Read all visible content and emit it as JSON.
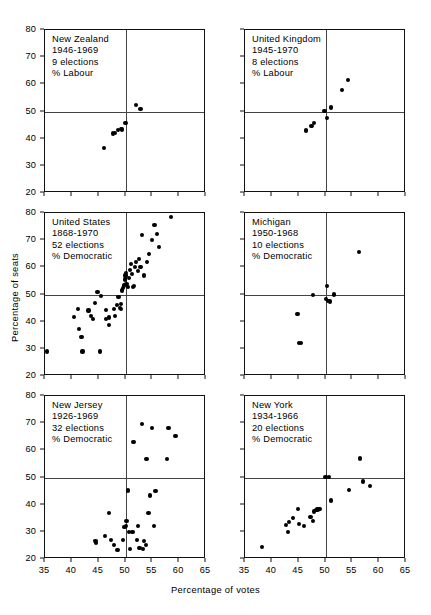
{
  "figure": {
    "xlabel": "Percentage of votes",
    "ylabel": "Percentage of seats"
  },
  "axes": {
    "xlim": [
      35,
      65
    ],
    "ylim": [
      20,
      80
    ],
    "xticks": [
      35,
      40,
      45,
      50,
      55,
      60,
      65
    ],
    "yticks": [
      20,
      30,
      40,
      50,
      60,
      70,
      80
    ],
    "reference_x": 50,
    "reference_y": 50,
    "grid": false
  },
  "chart_data": {
    "type": "scatter",
    "title": "",
    "xlabel": "Percentage of votes",
    "ylabel": "Percentage of seats",
    "xlim": [
      35,
      65
    ],
    "ylim": [
      20,
      80
    ],
    "xticks": [
      35,
      40,
      45,
      50,
      55,
      60,
      65
    ],
    "yticks": [
      20,
      30,
      40,
      50,
      60,
      70,
      80
    ],
    "grid": false,
    "legend": "none",
    "reference_lines": {
      "vertical_x": 50,
      "horizontal_y": 50
    },
    "panels": [
      {
        "id": "new-zealand",
        "row": 0,
        "col": 0,
        "caption_lines": [
          "New Zealand",
          "1946-1969",
          "9 elections",
          "% Labour"
        ],
        "region": "New Zealand",
        "period": "1946-1969",
        "elections": 9,
        "party": "% Labour",
        "points": [
          [
            46.0,
            36.7
          ],
          [
            47.6,
            41.9
          ],
          [
            48.1,
            42.0
          ],
          [
            48.6,
            43.2
          ],
          [
            49.2,
            43.5
          ],
          [
            49.3,
            43.4
          ],
          [
            50.0,
            45.8
          ],
          [
            51.9,
            52.3
          ],
          [
            52.8,
            50.8
          ]
        ]
      },
      {
        "id": "united-kingdom",
        "row": 0,
        "col": 1,
        "caption_lines": [
          "United Kingdom",
          "1945-1970",
          "8 elections",
          "% Labour"
        ],
        "region": "United Kingdom",
        "period": "1945-1970",
        "elections": 8,
        "party": "% Labour",
        "points": [
          [
            46.4,
            43.0
          ],
          [
            47.4,
            44.6
          ],
          [
            47.9,
            45.8
          ],
          [
            49.8,
            50.2
          ],
          [
            50.3,
            47.7
          ],
          [
            51.0,
            51.5
          ],
          [
            53.0,
            58.0
          ],
          [
            54.2,
            61.6
          ]
        ]
      },
      {
        "id": "united-states",
        "row": 1,
        "col": 0,
        "caption_lines": [
          "United States",
          "1868-1970",
          "52 elections",
          "% Democratic"
        ],
        "region": "United States",
        "period": "1868-1970",
        "elections": 52,
        "party": "% Democratic",
        "points": [
          [
            35.4,
            29.0
          ],
          [
            41.1,
            44.7
          ],
          [
            40.4,
            41.8
          ],
          [
            41.3,
            37.4
          ],
          [
            41.8,
            34.4
          ],
          [
            42.0,
            29.0
          ],
          [
            43.1,
            44.1
          ],
          [
            43.5,
            42.0
          ],
          [
            44.0,
            41.0
          ],
          [
            44.3,
            47.0
          ],
          [
            44.8,
            51.0
          ],
          [
            45.4,
            49.5
          ],
          [
            45.3,
            29.0
          ],
          [
            46.3,
            44.4
          ],
          [
            46.4,
            41.1
          ],
          [
            46.9,
            41.5
          ],
          [
            47.0,
            38.8
          ],
          [
            47.8,
            44.6
          ],
          [
            48.1,
            42.0
          ],
          [
            48.4,
            46.0
          ],
          [
            48.7,
            49.0
          ],
          [
            48.9,
            45.0
          ],
          [
            49.1,
            44.8
          ],
          [
            49.2,
            46.5
          ],
          [
            49.4,
            51.5
          ],
          [
            49.6,
            52.5
          ],
          [
            49.7,
            53.3
          ],
          [
            49.9,
            55.5
          ],
          [
            50.0,
            57.0
          ],
          [
            50.1,
            58.0
          ],
          [
            50.2,
            54.0
          ],
          [
            50.4,
            52.8
          ],
          [
            50.6,
            56.0
          ],
          [
            50.8,
            59.0
          ],
          [
            51.0,
            61.2
          ],
          [
            51.2,
            57.4
          ],
          [
            51.4,
            52.8
          ],
          [
            51.6,
            53.0
          ],
          [
            51.8,
            60.0
          ],
          [
            52.0,
            62.0
          ],
          [
            52.3,
            58.6
          ],
          [
            52.5,
            63.0
          ],
          [
            52.8,
            60.0
          ],
          [
            53.1,
            72.0
          ],
          [
            53.4,
            57.0
          ],
          [
            54.0,
            62.0
          ],
          [
            54.4,
            65.0
          ],
          [
            55.0,
            70.0
          ],
          [
            55.4,
            75.5
          ],
          [
            55.8,
            72.3
          ],
          [
            56.2,
            67.5
          ],
          [
            58.5,
            78.4
          ]
        ]
      },
      {
        "id": "michigan",
        "row": 1,
        "col": 1,
        "caption_lines": [
          "Michigan",
          "1950-1968",
          "10 elections",
          "% Democratic"
        ],
        "region": "Michigan",
        "period": "1950-1968",
        "elections": 10,
        "party": "% Democratic",
        "points": [
          [
            45.0,
            32.2
          ],
          [
            45.5,
            32.2
          ],
          [
            44.8,
            42.8
          ],
          [
            47.6,
            49.8
          ],
          [
            50.1,
            48.4
          ],
          [
            50.3,
            53.2
          ],
          [
            50.5,
            47.6
          ],
          [
            50.8,
            47.4
          ],
          [
            51.6,
            50.0
          ],
          [
            56.2,
            65.5
          ]
        ]
      },
      {
        "id": "new-jersey",
        "row": 2,
        "col": 0,
        "caption_lines": [
          "New Jersey",
          "1926-1969",
          "32 elections",
          "% Democratic"
        ],
        "region": "New Jersey",
        "period": "1926-1969",
        "elections": 32,
        "party": "% Democratic",
        "points": [
          [
            43.6,
            19.8
          ],
          [
            44.4,
            26.7
          ],
          [
            44.5,
            25.9
          ],
          [
            45.6,
            20.0
          ],
          [
            46.2,
            28.5
          ],
          [
            46.9,
            37.0
          ],
          [
            47.3,
            26.9
          ],
          [
            47.9,
            25.3
          ],
          [
            48.5,
            23.4
          ],
          [
            49.5,
            27.0
          ],
          [
            49.8,
            31.8
          ],
          [
            50.1,
            32.1
          ],
          [
            50.2,
            34.0
          ],
          [
            50.4,
            45.2
          ],
          [
            50.6,
            30.0
          ],
          [
            50.8,
            23.8
          ],
          [
            51.3,
            29.8
          ],
          [
            51.5,
            63.0
          ],
          [
            51.6,
            20.0
          ],
          [
            52.1,
            27.0
          ],
          [
            52.4,
            32.2
          ],
          [
            52.6,
            24.0
          ],
          [
            53.0,
            69.7
          ],
          [
            53.2,
            23.6
          ],
          [
            53.4,
            26.6
          ],
          [
            53.8,
            25.2
          ],
          [
            53.9,
            56.7
          ],
          [
            54.3,
            37.0
          ],
          [
            54.5,
            43.4
          ],
          [
            55.0,
            68.2
          ],
          [
            55.3,
            32.0
          ],
          [
            55.6,
            45.0
          ],
          [
            57.8,
            56.7
          ],
          [
            58.0,
            68.3
          ],
          [
            59.3,
            65.3
          ]
        ]
      },
      {
        "id": "new-york",
        "row": 2,
        "col": 1,
        "caption_lines": [
          "New York",
          "1934-1966",
          "20 elections",
          "% Democratic"
        ],
        "region": "New York",
        "period": "1934-1966",
        "elections": 20,
        "party": "% Democratic",
        "points": [
          [
            38.2,
            24.5
          ],
          [
            42.6,
            32.5
          ],
          [
            43.2,
            33.6
          ],
          [
            43.0,
            30.0
          ],
          [
            44.0,
            35.2
          ],
          [
            44.9,
            38.5
          ],
          [
            45.1,
            33.0
          ],
          [
            46.0,
            32.0
          ],
          [
            47.2,
            35.5
          ],
          [
            47.6,
            34.0
          ],
          [
            47.8,
            37.5
          ],
          [
            48.2,
            38.0
          ],
          [
            48.5,
            38.2
          ],
          [
            48.8,
            38.4
          ],
          [
            49.0,
            38.4
          ],
          [
            50.0,
            50.2
          ],
          [
            50.7,
            50.2
          ],
          [
            51.0,
            41.5
          ],
          [
            54.4,
            45.5
          ],
          [
            56.5,
            57.0
          ],
          [
            57.0,
            48.5
          ],
          [
            58.3,
            47.0
          ]
        ]
      }
    ]
  }
}
